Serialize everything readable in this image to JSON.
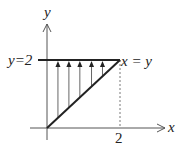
{
  "diagram": {
    "type": "integration-region",
    "axes": {
      "x_label": "x",
      "y_label": "y"
    },
    "boundaries": [
      {
        "name": "top",
        "equation": "y=2",
        "label": "y=2"
      },
      {
        "name": "diagonal",
        "equation": "x=y",
        "label": "x = y"
      }
    ],
    "ticks": {
      "x": [
        {
          "value": 2,
          "label": "2"
        }
      ]
    },
    "region": {
      "description": "Triangle bounded by y = x (x = y), y = 2, and x = 0",
      "vertices": [
        [
          0,
          0
        ],
        [
          0,
          2
        ],
        [
          2,
          2
        ]
      ]
    },
    "arrows": {
      "direction": "up",
      "from": "x=y",
      "to": "y=2",
      "x_values": [
        0.3,
        0.6,
        0.9,
        1.22,
        1.52
      ]
    },
    "colors": {
      "ink": "#222222",
      "axis": "#555555",
      "arrow": "#666666",
      "guide": "#555555"
    }
  }
}
